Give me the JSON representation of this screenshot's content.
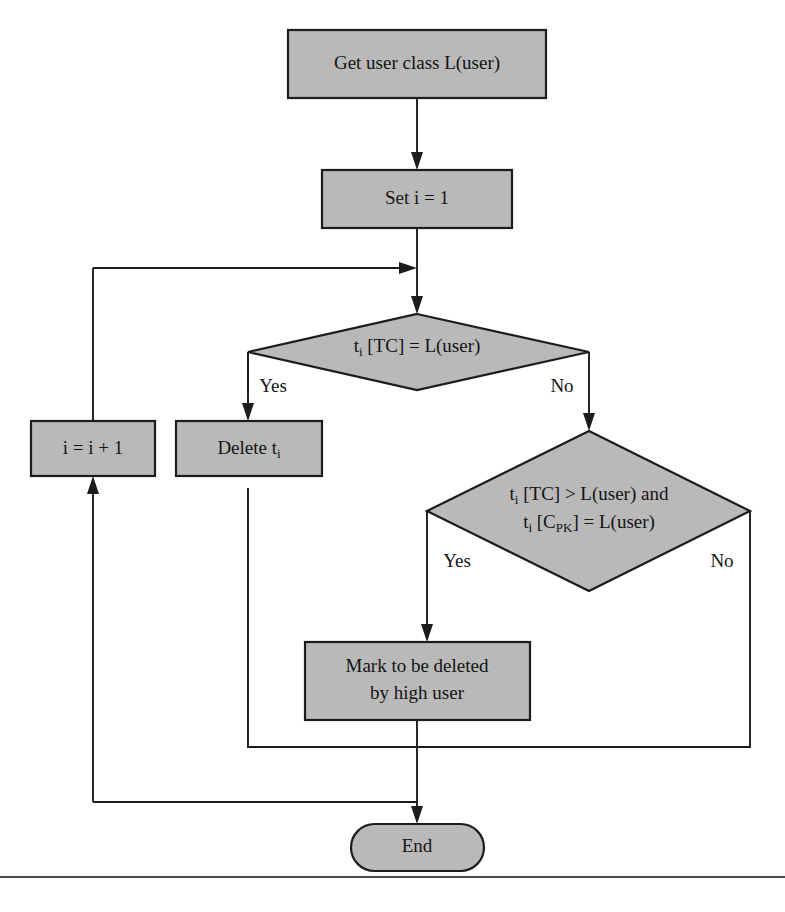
{
  "diagram": {
    "type": "flowchart",
    "background_color": "#ffffff",
    "node_fill_color": "#b9b9b9",
    "node_stroke_color": "#1c1c1c",
    "text_color": "#141414",
    "nodes": [
      {
        "id": "get-user-class",
        "shape": "process",
        "label": "Get user class L(user)"
      },
      {
        "id": "set-i",
        "shape": "process",
        "label": "Set i = 1"
      },
      {
        "id": "decision-tc-equal",
        "shape": "decision",
        "label_parts": {
          "base1": "t",
          "sub1": "i",
          "rest1": " [TC] = L(user)"
        },
        "label": "t i [TC] = L(user)"
      },
      {
        "id": "increment-i",
        "shape": "process",
        "label": "i = i + 1"
      },
      {
        "id": "delete-ti",
        "shape": "process",
        "label_parts": {
          "base1": "Delete t",
          "sub1": "i"
        },
        "label": "Delete t i"
      },
      {
        "id": "decision-tc-greater",
        "shape": "decision",
        "line1": {
          "base": "t",
          "sub": "i",
          "rest": " [TC] > L(user) and"
        },
        "line2": {
          "base": "t",
          "sub": "i",
          "rest_a": " [C",
          "sub2": "PK",
          "rest_b": "] = L(user)"
        },
        "label": "t i [TC] > L(user) and t i [C PK] = L(user)"
      },
      {
        "id": "mark-deleted",
        "shape": "process",
        "line1": "Mark to be deleted",
        "line2": "by high user",
        "label": "Mark to be deleted by high user"
      },
      {
        "id": "end",
        "shape": "terminator",
        "label": "End"
      }
    ],
    "edge_labels": {
      "decision1_yes": "Yes",
      "decision1_no": "No",
      "decision2_yes": "Yes",
      "decision2_no": "No"
    }
  },
  "caption": {
    "text": ""
  }
}
